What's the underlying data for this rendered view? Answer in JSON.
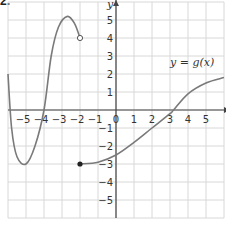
{
  "problem_label": "2.",
  "chart_data": {
    "type": "line",
    "title": "",
    "xlabel": "x",
    "ylabel": "y",
    "function_label": "y = g(x)",
    "xlim": [
      -6,
      6
    ],
    "ylim": [
      -6,
      6
    ],
    "grid": true,
    "x_ticks": [
      -5,
      -4,
      -3,
      -2,
      -1,
      0,
      1,
      2,
      3,
      4,
      5
    ],
    "y_ticks": [
      -5,
      -4,
      -3,
      -2,
      -1,
      1,
      2,
      3,
      4,
      5
    ],
    "series": [
      {
        "name": "g(x) left branch",
        "points": [
          [
            -6,
            2
          ],
          [
            -5.8,
            -1
          ],
          [
            -5.5,
            -2.6
          ],
          [
            -5,
            -3
          ],
          [
            -4.5,
            -2
          ],
          [
            -4,
            0
          ],
          [
            -3.6,
            3
          ],
          [
            -3.2,
            4.6
          ],
          [
            -2.7,
            5.2
          ],
          [
            -2.3,
            4.8
          ],
          [
            -2,
            4
          ]
        ],
        "start": {
          "x": -6,
          "y": 2,
          "type": "endpoint"
        },
        "end": {
          "x": -2,
          "y": 4,
          "type": "open"
        }
      },
      {
        "name": "g(x) right branch",
        "points": [
          [
            -2,
            -3
          ],
          [
            -1,
            -2.9
          ],
          [
            0,
            -2.5
          ],
          [
            1,
            -1.8
          ],
          [
            2,
            -1
          ],
          [
            3,
            -0.2
          ],
          [
            3.2,
            0
          ],
          [
            4,
            0.9
          ],
          [
            5,
            1.5
          ],
          [
            6,
            1.8
          ]
        ],
        "start": {
          "x": -2,
          "y": -3,
          "type": "closed"
        },
        "end": {
          "x": 6,
          "y": 1.8,
          "type": "continues"
        }
      }
    ],
    "colors": {
      "curve": "#7a7a7a",
      "grid": "#d8d8d8",
      "axis": "#444444",
      "text": "#333333"
    }
  }
}
